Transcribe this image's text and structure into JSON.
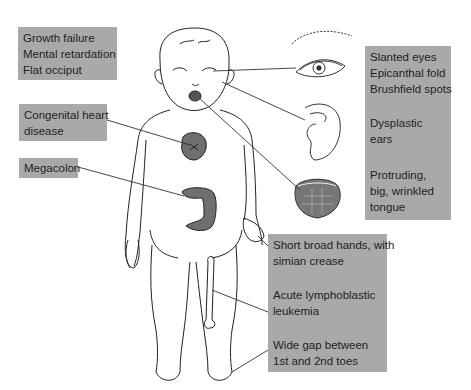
{
  "diagram": {
    "labels": {
      "growth": [
        "Growth failure",
        "Mental retardation",
        "Flat occiput"
      ],
      "heart": [
        "Congenital heart",
        "disease"
      ],
      "megacolon": [
        "Megacolon"
      ],
      "eyes": [
        "Slanted eyes",
        "Epicanthal fold",
        "Brushfield spots"
      ],
      "ears": [
        "Dysplastic",
        "ears"
      ],
      "tongue": [
        "Protruding,",
        "big, wrinkled",
        "tongue"
      ],
      "hands": [
        "Short broad hands, with",
        "simian crease"
      ],
      "leukemia": [
        "Acute lymphoblastic",
        "leukemia"
      ],
      "toes": [
        "Wide gap between",
        "1st and 2nd toes"
      ]
    },
    "colors": {
      "label_box": "#a9a9a9",
      "label_text": "#1e1e1e",
      "organ_fill": "#6f6f6f",
      "line": "#333333"
    }
  }
}
